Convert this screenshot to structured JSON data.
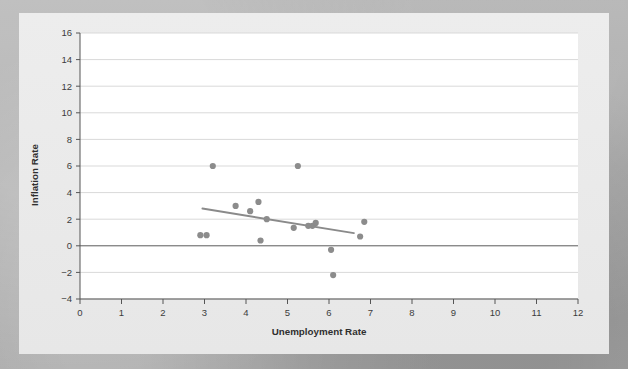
{
  "chart_data": {
    "type": "scatter",
    "title": "",
    "xlabel": "Unemployment Rate",
    "ylabel": "Inflation Rate",
    "xlim": [
      0,
      12
    ],
    "ylim": [
      -4,
      16
    ],
    "xticks": [
      0,
      1,
      2,
      3,
      4,
      5,
      6,
      7,
      8,
      9,
      10,
      11,
      12
    ],
    "xtick_labels": [
      "0",
      "1",
      "2",
      "3",
      "4",
      "5",
      "6",
      "7",
      "8",
      "9",
      "10",
      "11",
      "12"
    ],
    "yticks": [
      -4,
      -2,
      0,
      2,
      4,
      6,
      8,
      10,
      12,
      14,
      16
    ],
    "ytick_labels": [
      "-4",
      "-2",
      "0",
      "2",
      "4",
      "6",
      "8",
      "10",
      "12",
      "14",
      "16"
    ],
    "grid": "horizontal",
    "legend": "none",
    "marker_color": "#8c8c8c",
    "trendline_color": "#8a8a8a",
    "gridline_color": "#d9d9d9",
    "zero_line_color": "#5a5a5a",
    "plot_background": "#ffffff",
    "points": [
      {
        "x": 2.9,
        "y": 0.8
      },
      {
        "x": 3.05,
        "y": 0.8
      },
      {
        "x": 3.2,
        "y": 6.0
      },
      {
        "x": 3.75,
        "y": 3.0
      },
      {
        "x": 4.1,
        "y": 2.6
      },
      {
        "x": 4.3,
        "y": 3.3
      },
      {
        "x": 4.35,
        "y": 0.4
      },
      {
        "x": 4.5,
        "y": 2.0
      },
      {
        "x": 5.15,
        "y": 1.35
      },
      {
        "x": 5.25,
        "y": 6.0
      },
      {
        "x": 5.5,
        "y": 1.5
      },
      {
        "x": 5.6,
        "y": 1.5
      },
      {
        "x": 5.68,
        "y": 1.72
      },
      {
        "x": 6.05,
        "y": -0.3
      },
      {
        "x": 6.1,
        "y": -2.2
      },
      {
        "x": 6.75,
        "y": 0.7
      },
      {
        "x": 6.85,
        "y": 1.8
      }
    ],
    "trendline": {
      "x_start": 2.95,
      "y_start": 2.8,
      "x_end": 6.6,
      "y_end": 0.95
    }
  }
}
